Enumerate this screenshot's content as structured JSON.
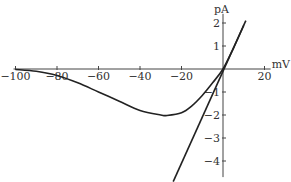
{
  "chart_data": {
    "type": "line",
    "title": "",
    "xlabel": "mV",
    "ylabel": "pA",
    "xlim": [
      -100,
      22
    ],
    "ylim": [
      -4.7,
      2.4
    ],
    "x_ticks": [
      -100,
      -80,
      -60,
      -40,
      -20,
      20
    ],
    "y_ticks": [
      -4,
      -3,
      -2,
      -1,
      1,
      2
    ],
    "grid": false,
    "legend": null,
    "series": [
      {
        "name": "I-V curve",
        "x": [
          -100,
          -90,
          -80,
          -70,
          -60,
          -50,
          -40,
          -30,
          -27,
          -20,
          -15,
          -10,
          -5,
          0,
          5,
          10
        ],
        "y": [
          -0.02,
          -0.1,
          -0.28,
          -0.6,
          -1.0,
          -1.4,
          -1.8,
          -2.0,
          -2.02,
          -1.9,
          -1.6,
          -1.15,
          -0.6,
          0,
          0.9,
          1.9
        ]
      },
      {
        "name": "linear fit",
        "x": [
          -24,
          11
        ],
        "y": [
          -4.9,
          2.1
        ]
      }
    ]
  },
  "axes": {
    "x_unit": "mV",
    "y_unit": "pA",
    "x_tick_labels": [
      "-100",
      "-80",
      "-60",
      "-40",
      "-20",
      "20"
    ],
    "y_tick_labels": [
      "2",
      "1",
      "-1",
      "-2",
      "-3",
      "-4"
    ]
  }
}
